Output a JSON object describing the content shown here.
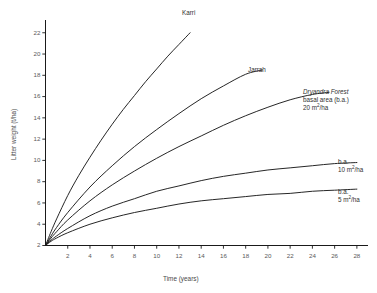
{
  "chart_data": {
    "type": "line",
    "title": "",
    "xlabel": "Time (years)",
    "ylabel": "Litter weight (t/ha)",
    "xlim": [
      0,
      29
    ],
    "ylim": [
      2,
      23.2
    ],
    "xticks": [
      2,
      4,
      6,
      8,
      10,
      12,
      14,
      16,
      18,
      20,
      22,
      24,
      26,
      28
    ],
    "yticks": [
      2,
      4,
      6,
      8,
      10,
      12,
      14,
      16,
      18,
      20,
      22
    ],
    "grid": false,
    "legend_position": "inline-curve-end-labels",
    "line_color": "#1a1a1a",
    "series": [
      {
        "name": "Karri",
        "label_lines": [
          "Karri"
        ],
        "x": [
          0,
          0.5,
          1,
          2,
          3,
          4,
          5,
          6,
          7,
          8,
          9,
          10,
          11,
          12,
          13
        ],
        "y": [
          2.0,
          3.3,
          4.5,
          6.7,
          8.6,
          10.3,
          11.9,
          13.4,
          14.8,
          16.1,
          17.4,
          18.6,
          19.8,
          20.9,
          22.0
        ]
      },
      {
        "name": "Jarrah",
        "label_lines": [
          "Jarrah"
        ],
        "x": [
          0,
          0.5,
          1,
          2,
          4,
          6,
          8,
          10,
          12,
          14,
          16,
          18,
          19.5
        ],
        "y": [
          2.0,
          2.9,
          3.7,
          5.1,
          7.5,
          9.5,
          11.3,
          12.9,
          14.4,
          15.8,
          17.0,
          18.1,
          18.5
        ]
      },
      {
        "name": "Dryandra Forest basal area (b.a.) 20 m2/ha",
        "label_lines": [
          "Dryandra Forest",
          "basal area (b.a.)",
          "20 m²/ha"
        ],
        "x": [
          0,
          0.5,
          1,
          2,
          4,
          6,
          8,
          10,
          12,
          14,
          16,
          18,
          20,
          22,
          24,
          25.5
        ],
        "y": [
          2.0,
          2.7,
          3.3,
          4.4,
          6.2,
          7.7,
          9.0,
          10.2,
          11.3,
          12.3,
          13.3,
          14.2,
          15.0,
          15.7,
          16.2,
          16.4
        ]
      },
      {
        "name": "b.a. 10 m2/ha",
        "label_lines": [
          "b.a.",
          "10 m²/ha"
        ],
        "x": [
          0,
          0.5,
          1,
          2,
          4,
          6,
          8,
          10,
          12,
          14,
          16,
          18,
          20,
          22,
          24,
          26,
          28
        ],
        "y": [
          2.0,
          2.5,
          2.9,
          3.6,
          4.8,
          5.7,
          6.4,
          7.1,
          7.6,
          8.1,
          8.5,
          8.8,
          9.1,
          9.3,
          9.5,
          9.7,
          9.8
        ]
      },
      {
        "name": "b.a. 5 m2/ha",
        "label_lines": [
          "b.a.",
          "5 m²/ha"
        ],
        "x": [
          0,
          0.5,
          1,
          2,
          4,
          6,
          8,
          10,
          12,
          14,
          16,
          18,
          20,
          22,
          24,
          26,
          28
        ],
        "y": [
          2.0,
          2.4,
          2.7,
          3.2,
          4.0,
          4.6,
          5.1,
          5.5,
          5.9,
          6.2,
          6.4,
          6.6,
          6.8,
          6.9,
          7.1,
          7.2,
          7.3
        ]
      }
    ]
  },
  "axes": {
    "y_title": "Litter weight (t/ha)",
    "x_title": "Time (years)",
    "y_tick_labels": [
      "2",
      "4",
      "6",
      "8",
      "10",
      "12",
      "14",
      "16",
      "18",
      "20",
      "22"
    ],
    "x_tick_labels": [
      "2",
      "4",
      "6",
      "8",
      "10",
      "12",
      "14",
      "16",
      "18",
      "20",
      "22",
      "24",
      "26",
      "28"
    ]
  },
  "annotations": {
    "karri": "Karri",
    "jarrah": "Jarrah",
    "dryandra_line1": "Dryandra Forest",
    "dryandra_line2": "basal area (b.a.)",
    "dryandra_line3_value": "20",
    "dryandra_line3_unit": "m",
    "dryandra_line3_exp": "2",
    "dryandra_line3_tail": "/ha",
    "ba10_line1": "b.a.",
    "ba10_value": "10",
    "ba10_unit": "m",
    "ba10_exp": "2",
    "ba10_tail": "/ha",
    "ba5_line1": "b.a.",
    "ba5_value": "5",
    "ba5_unit": "m",
    "ba5_exp": "2",
    "ba5_tail": "/ha"
  }
}
